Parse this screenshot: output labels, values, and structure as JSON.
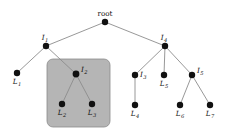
{
  "figure": {
    "type": "tree-diagram",
    "title": "",
    "background_color": "#ffffff",
    "edge_color": "#8c8c8c",
    "node_color": "#111111",
    "highlight_box": {
      "name": "subtree-highlight-box",
      "fill": "#b5b5b5",
      "stroke": "#8a8a8a",
      "x": 47,
      "y": 59,
      "width": 63,
      "height": 68,
      "radius": 6
    },
    "nodes": [
      {
        "id": "root",
        "label": "root",
        "sub": "",
        "x": 105,
        "y": 22,
        "r": 3.2,
        "label_dx": 0,
        "label_dy": -6,
        "label_anchor": "middle",
        "italic": false
      },
      {
        "id": "I1",
        "label": "I",
        "sub": "1",
        "x": 46,
        "y": 46,
        "r": 3.2,
        "label_dx": -1,
        "label_dy": -6,
        "label_anchor": "middle",
        "italic": true
      },
      {
        "id": "I4",
        "label": "I",
        "sub": "4",
        "x": 165,
        "y": 46,
        "r": 3.2,
        "label_dx": -1,
        "label_dy": -6,
        "label_anchor": "middle",
        "italic": true
      },
      {
        "id": "L1",
        "label": "L",
        "sub": "1",
        "x": 17,
        "y": 73,
        "r": 3.2,
        "label_dx": 0,
        "label_dy": 11,
        "label_anchor": "middle",
        "italic": true
      },
      {
        "id": "I2",
        "label": "I",
        "sub": "2",
        "x": 76,
        "y": 74,
        "r": 3.4,
        "label_dx": 5,
        "label_dy": -2,
        "label_anchor": "start",
        "italic": true
      },
      {
        "id": "L2",
        "label": "L",
        "sub": "2",
        "x": 62,
        "y": 104,
        "r": 3.2,
        "label_dx": 0,
        "label_dy": 11,
        "label_anchor": "middle",
        "italic": true
      },
      {
        "id": "L3",
        "label": "L",
        "sub": "3",
        "x": 92,
        "y": 104,
        "r": 3.2,
        "label_dx": 0,
        "label_dy": 11,
        "label_anchor": "middle",
        "italic": true
      },
      {
        "id": "I3",
        "label": "I",
        "sub": "3",
        "x": 135,
        "y": 75,
        "r": 3.2,
        "label_dx": 5,
        "label_dy": 2,
        "label_anchor": "start",
        "italic": true
      },
      {
        "id": "L5",
        "label": "L",
        "sub": "5",
        "x": 164,
        "y": 75,
        "r": 3.2,
        "label_dx": 0,
        "label_dy": 11,
        "label_anchor": "middle",
        "italic": true
      },
      {
        "id": "I5",
        "label": "I",
        "sub": "5",
        "x": 192,
        "y": 75,
        "r": 3.2,
        "label_dx": 5,
        "label_dy": -2,
        "label_anchor": "start",
        "italic": true
      },
      {
        "id": "L4",
        "label": "L",
        "sub": "4",
        "x": 135,
        "y": 105,
        "r": 3.2,
        "label_dx": 0,
        "label_dy": 11,
        "label_anchor": "middle",
        "italic": true
      },
      {
        "id": "L6",
        "label": "L",
        "sub": "6",
        "x": 180,
        "y": 105,
        "r": 3.2,
        "label_dx": 0,
        "label_dy": 11,
        "label_anchor": "middle",
        "italic": true
      },
      {
        "id": "L7",
        "label": "L",
        "sub": "7",
        "x": 210,
        "y": 105,
        "r": 3.2,
        "label_dx": 0,
        "label_dy": 11,
        "label_anchor": "middle",
        "italic": true
      }
    ],
    "edges": [
      {
        "from": "root",
        "to": "I1"
      },
      {
        "from": "root",
        "to": "I4"
      },
      {
        "from": "I1",
        "to": "L1"
      },
      {
        "from": "I1",
        "to": "I2"
      },
      {
        "from": "I2",
        "to": "L2"
      },
      {
        "from": "I2",
        "to": "L3"
      },
      {
        "from": "I4",
        "to": "I3"
      },
      {
        "from": "I4",
        "to": "L5"
      },
      {
        "from": "I4",
        "to": "I5"
      },
      {
        "from": "I3",
        "to": "L4"
      },
      {
        "from": "I5",
        "to": "L6"
      },
      {
        "from": "I5",
        "to": "L7"
      }
    ]
  }
}
